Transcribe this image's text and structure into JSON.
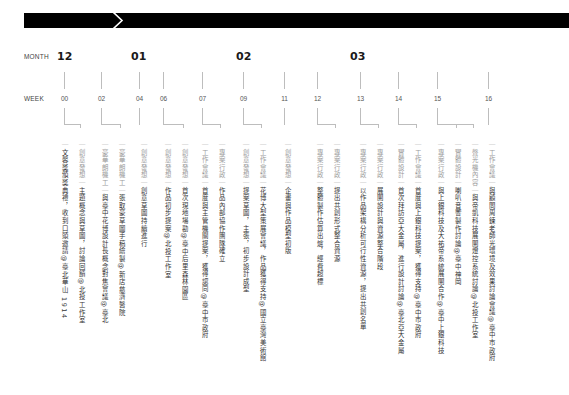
{
  "labels": {
    "month": "MONTH",
    "week": "WEEK"
  },
  "colors": {
    "banner": "#000000",
    "lines": "#bdbdbd",
    "category_text": "#9a9a9a",
    "body_text": "#333333"
  },
  "months": [
    {
      "label": "12",
      "x": 57
    },
    {
      "label": "01",
      "x": 131
    },
    {
      "label": "02",
      "x": 236
    },
    {
      "label": "03",
      "x": 350
    }
  ],
  "weeks": [
    {
      "label": "00",
      "x": 64
    },
    {
      "label": "02",
      "x": 101
    },
    {
      "label": "04",
      "x": 139
    },
    {
      "label": "06",
      "x": 163
    },
    {
      "label": "07",
      "x": 202
    },
    {
      "label": "09",
      "x": 243
    },
    {
      "label": "11",
      "x": 284
    },
    {
      "label": "12",
      "x": 317
    },
    {
      "label": "13",
      "x": 360
    },
    {
      "label": "14",
      "x": 398
    },
    {
      "label": "15",
      "x": 437
    },
    {
      "label": "16",
      "x": 488
    }
  ],
  "entries": [
    {
      "week": "00",
      "x": 60,
      "category": "",
      "text": "文馨獎頒獎典禮，收到口頭邀請@臺北華山 1914"
    },
    {
      "week": "00",
      "x": 77,
      "category": "創意發想",
      "text": "主題概念與草圖，討論回饋@北投工作室"
    },
    {
      "week": "02",
      "x": 100,
      "category": "豪華朗機工",
      "text": "與臺中花博設計長概念對焦會議@臺北"
    },
    {
      "week": "02",
      "x": 117,
      "category": "豪華朗機工",
      "text": "張取豪草圖手稿繪製@新店慈濟醫院"
    },
    {
      "week": "04",
      "x": 139,
      "category": "創意發想",
      "text": "創意草圖持續進行"
    },
    {
      "week": "06",
      "x": 163,
      "category": "創意發想",
      "text": "作品初步提案@北投工作室"
    },
    {
      "week": "06",
      "x": 180,
      "category": "創意發想",
      "text": "首次現地場勘@臺中后里森林園區"
    },
    {
      "week": "07",
      "x": 200,
      "category": "工作會議",
      "text": "首度與主管機關提案，獲得認同@臺中市政府"
    },
    {
      "week": "07",
      "x": 217,
      "category": "專案行政",
      "text": "作品內部協作團隊確立"
    },
    {
      "week": "09",
      "x": 241,
      "category": "創意發想",
      "text": "提案草圖，主張，初步設計成型"
    },
    {
      "week": "09",
      "x": 258,
      "category": "工作會議",
      "text": "花博大型策展會議，作品獲得支持@國立臺灣美術館"
    },
    {
      "week": "11",
      "x": 283,
      "category": "創意發想",
      "text": "企畫與作品模型初版"
    },
    {
      "week": "12",
      "x": 315,
      "category": "專案行政",
      "text": "整體製作估算出爐，經費超標"
    },
    {
      "week": "12",
      "x": 332,
      "category": "專案行政",
      "text": "提出共創形式整合資源"
    },
    {
      "week": "13",
      "x": 358,
      "category": "專案行政",
      "text": "以作品架構分析可行性資源，提出共創名單"
    },
    {
      "week": "13",
      "x": 375,
      "category": "專案行政",
      "text": "展開設計與資源整合階段"
    },
    {
      "week": "14",
      "x": 396,
      "category": "實體設計",
      "text": "首次拜訪亞大金屬，進行設計討論@臺北亞大金屬"
    },
    {
      "week": "14",
      "x": 413,
      "category": "工作會議",
      "text": "首度與上銀科技提案，獲得支持@臺中市政府"
    },
    {
      "week": "15",
      "x": 436,
      "category": "專案行政",
      "text": "與上銀科技及大祐帝系統展開合作@臺中上銀科技"
    },
    {
      "week": "15",
      "x": 453,
      "category": "實體設計",
      "text": "喇叭音響製作討論@臺中神岡"
    },
    {
      "week": "15",
      "x": 470,
      "category": "聲光機內容",
      "text": "與帝凱科技展開燈控系統討論@北投工作室"
    },
    {
      "week": "16",
      "x": 487,
      "category": "工作會議",
      "text": "與顧問周鍊老師光環境及效果討論會議@臺中市政府"
    }
  ]
}
